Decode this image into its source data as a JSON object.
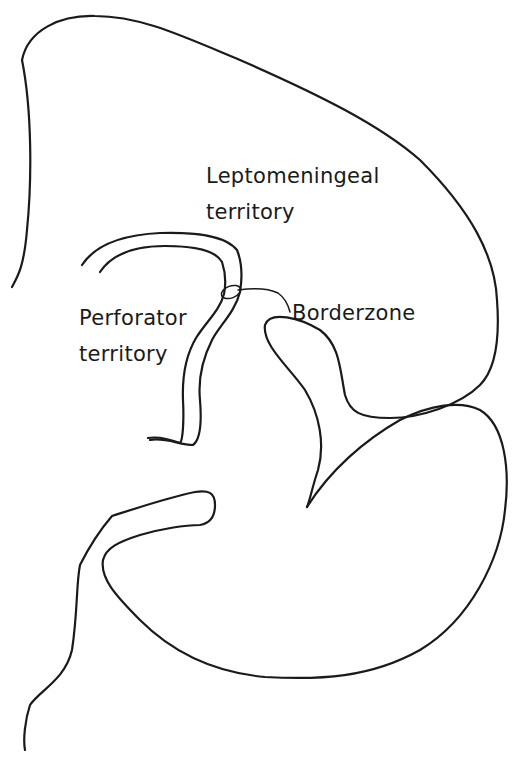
{
  "diagram": {
    "type": "anatomical line drawing",
    "stroke_color": "#1a1a1a",
    "background_color": "#ffffff",
    "labels": {
      "leptomeningeal": {
        "line1": "Leptomeningeal",
        "line2": "territory"
      },
      "perforator": {
        "line1": "Perforator",
        "line2": "territory"
      },
      "borderzone": {
        "text": "Borderzone"
      }
    }
  }
}
